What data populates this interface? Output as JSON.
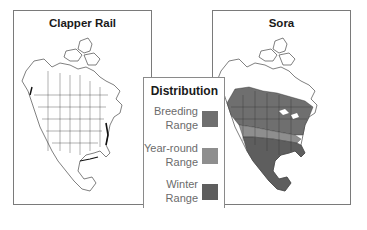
{
  "panels": [
    {
      "title": "Clapper Rail",
      "map": "north-america-outline",
      "highlighted_ranges": [
        "coastal breeding (east/gulf, dark outline)"
      ]
    },
    {
      "title": "Sora",
      "map": "north-america-range",
      "highlighted_ranges": [
        "breeding",
        "year-round",
        "winter"
      ]
    }
  ],
  "legend": {
    "title": "Distribution",
    "items": [
      {
        "label": "Breeding\nRange",
        "color": "#6f6f6f"
      },
      {
        "label": "Year-round\nRange",
        "color": "#8e8e8e"
      },
      {
        "label": "Winter\nRange",
        "color": "#5e5e5e"
      }
    ]
  },
  "colors": {
    "breeding": "#6f6f6f",
    "year_round": "#8e8e8e",
    "winter": "#5e5e5e",
    "border": "#7a7a7a",
    "outline": "#222222"
  }
}
